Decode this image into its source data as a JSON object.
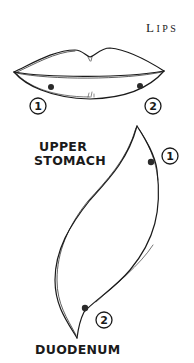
{
  "labels": {
    "lips_first": "L",
    "lips_rest": "IPS",
    "upper_stomach_line1": "UPPER",
    "upper_stomach_line2": "STOMACH",
    "duodenum": "DUODENUM"
  },
  "markers": {
    "lips_left": "1",
    "lips_right": "2",
    "stomach_top": "1",
    "stomach_bottom": "2"
  }
}
